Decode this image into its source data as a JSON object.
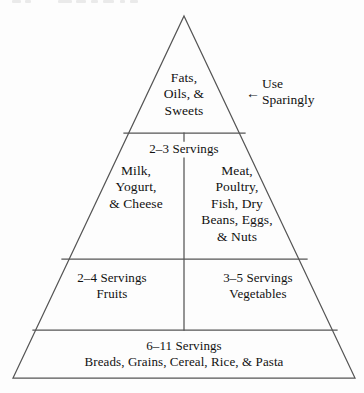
{
  "diagram": {
    "background_color": "#fdfdfd",
    "line_color": "#555555",
    "text_color": "#111111"
  },
  "annotation": {
    "arrow_icon": "←",
    "text": "Use\nSparingly"
  },
  "tiers": {
    "fats": {
      "label": "Fats,\nOils, &\nSweets"
    },
    "dairy_meat": {
      "servings": "2–3 Servings",
      "dairy_label": "Milk,\nYogurt,\n& Cheese",
      "meat_label": "Meat,\nPoultry,\nFish, Dry\nBeans, Eggs,\n& Nuts"
    },
    "fruits": {
      "label": "2–4 Servings\nFruits"
    },
    "vegetables": {
      "label": "3–5 Servings\nVegetables"
    },
    "grains": {
      "label": "6–11 Servings\nBreads, Grains, Cereal, Rice, & Pasta"
    }
  },
  "geometry": {
    "apex": "184,16",
    "base_left": "13,378",
    "base_right": "355,378",
    "divider_1": "124,133 245,133",
    "divider_2": "62,259 307,259",
    "divider_3": "33,330 337,330",
    "center_x": "184"
  }
}
